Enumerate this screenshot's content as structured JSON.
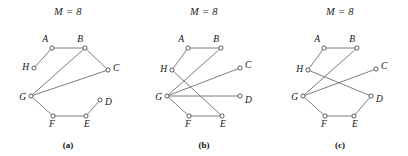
{
  "figure": {
    "width": 408,
    "height": 156,
    "background": "#ffffff",
    "edge_color": "#6e6e6e",
    "node_stroke_color": "#4a4a4a",
    "node_fill_color": "#ffffff",
    "text_color": "#121212"
  },
  "panels": [
    {
      "id": "panel-a",
      "title": "M = 8",
      "caption": "(a)",
      "nodes": [
        {
          "id": "A",
          "label": "A",
          "x": 52,
          "y": 24,
          "label_dx": -4,
          "label_dy": -6,
          "label_anchor": "end"
        },
        {
          "id": "B",
          "label": "B",
          "x": 85,
          "y": 24,
          "label_dx": -2,
          "label_dy": -6,
          "label_anchor": "end"
        },
        {
          "id": "C",
          "label": "C",
          "x": 108,
          "y": 46,
          "label_dx": 5,
          "label_dy": 1,
          "label_anchor": "start"
        },
        {
          "id": "D",
          "label": "D",
          "x": 100,
          "y": 76,
          "label_dx": 5,
          "label_dy": 5,
          "label_anchor": "start"
        },
        {
          "id": "E",
          "label": "E",
          "x": 86,
          "y": 92,
          "label_dx": 1,
          "label_dy": 11,
          "label_anchor": "middle"
        },
        {
          "id": "F",
          "label": "F",
          "x": 53,
          "y": 92,
          "label_dx": -1,
          "label_dy": 11,
          "label_anchor": "middle"
        },
        {
          "id": "G",
          "label": "G",
          "x": 31,
          "y": 72,
          "label_dx": -5,
          "label_dy": 4,
          "label_anchor": "end"
        },
        {
          "id": "H",
          "label": "H",
          "x": 34,
          "y": 44,
          "label_dx": -5,
          "label_dy": 2,
          "label_anchor": "end"
        }
      ],
      "edges": [
        [
          "A",
          "B"
        ],
        [
          "A",
          "H"
        ],
        [
          "B",
          "C"
        ],
        [
          "B",
          "G"
        ],
        [
          "C",
          "G"
        ],
        [
          "G",
          "F"
        ],
        [
          "F",
          "E"
        ],
        [
          "E",
          "D"
        ]
      ]
    },
    {
      "id": "panel-b",
      "title": "M = 8",
      "caption": "(b)",
      "nodes": [
        {
          "id": "A",
          "label": "A",
          "x": 52,
          "y": 24,
          "label_dx": -4,
          "label_dy": -6,
          "label_anchor": "end"
        },
        {
          "id": "B",
          "label": "B",
          "x": 85,
          "y": 24,
          "label_dx": -2,
          "label_dy": -6,
          "label_anchor": "end"
        },
        {
          "id": "C",
          "label": "C",
          "x": 104,
          "y": 44,
          "label_dx": 5,
          "label_dy": 0,
          "label_anchor": "start"
        },
        {
          "id": "D",
          "label": "D",
          "x": 104,
          "y": 72,
          "label_dx": 5,
          "label_dy": 7,
          "label_anchor": "start"
        },
        {
          "id": "E",
          "label": "E",
          "x": 86,
          "y": 92,
          "label_dx": 1,
          "label_dy": 11,
          "label_anchor": "middle"
        },
        {
          "id": "F",
          "label": "F",
          "x": 53,
          "y": 92,
          "label_dx": -1,
          "label_dy": 11,
          "label_anchor": "middle"
        },
        {
          "id": "G",
          "label": "G",
          "x": 31,
          "y": 72,
          "label_dx": -5,
          "label_dy": 4,
          "label_anchor": "end"
        },
        {
          "id": "H",
          "label": "H",
          "x": 36,
          "y": 46,
          "label_dx": -5,
          "label_dy": 2,
          "label_anchor": "end"
        }
      ],
      "edges": [
        [
          "A",
          "B"
        ],
        [
          "A",
          "H"
        ],
        [
          "B",
          "G"
        ],
        [
          "C",
          "G"
        ],
        [
          "G",
          "D"
        ],
        [
          "G",
          "F"
        ],
        [
          "F",
          "E"
        ],
        [
          "H",
          "E"
        ]
      ]
    },
    {
      "id": "panel-c",
      "title": "M = 8",
      "caption": "(c)",
      "nodes": [
        {
          "id": "A",
          "label": "A",
          "x": 52,
          "y": 24,
          "label_dx": -4,
          "label_dy": -6,
          "label_anchor": "end"
        },
        {
          "id": "B",
          "label": "B",
          "x": 85,
          "y": 24,
          "label_dx": -2,
          "label_dy": -6,
          "label_anchor": "end"
        },
        {
          "id": "C",
          "label": "C",
          "x": 104,
          "y": 45,
          "label_dx": 5,
          "label_dy": 0,
          "label_anchor": "start"
        },
        {
          "id": "D",
          "label": "D",
          "x": 99,
          "y": 72,
          "label_dx": 5,
          "label_dy": 6,
          "label_anchor": "start"
        },
        {
          "id": "E",
          "label": "E",
          "x": 82,
          "y": 92,
          "label_dx": 1,
          "label_dy": 11,
          "label_anchor": "middle"
        },
        {
          "id": "F",
          "label": "F",
          "x": 53,
          "y": 92,
          "label_dx": -1,
          "label_dy": 11,
          "label_anchor": "middle"
        },
        {
          "id": "G",
          "label": "G",
          "x": 31,
          "y": 72,
          "label_dx": -5,
          "label_dy": 4,
          "label_anchor": "end"
        },
        {
          "id": "H",
          "label": "H",
          "x": 36,
          "y": 46,
          "label_dx": -5,
          "label_dy": 2,
          "label_anchor": "end"
        }
      ],
      "edges": [
        [
          "A",
          "B"
        ],
        [
          "A",
          "H"
        ],
        [
          "B",
          "G"
        ],
        [
          "C",
          "G"
        ],
        [
          "G",
          "F"
        ],
        [
          "F",
          "E"
        ],
        [
          "E",
          "D"
        ],
        [
          "H",
          "D"
        ]
      ]
    }
  ]
}
